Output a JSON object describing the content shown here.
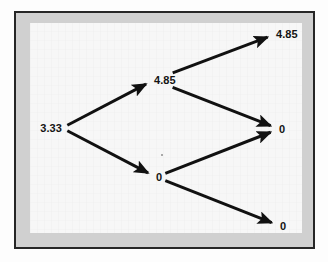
{
  "figure": {
    "type": "binomial-lattice-diagram",
    "frame": {
      "border_color": "#262626",
      "band_color": "#d0d0d0",
      "canvas_color": "#f7f7f7"
    },
    "style": {
      "edge_color": "#111111",
      "edge_width": 3,
      "label_color": "#141414"
    }
  },
  "chart_data": {
    "type": "diagram",
    "subtype": "binomial-tree",
    "xlabel": "",
    "ylabel": "",
    "grid": false,
    "legend": null,
    "periods": 2,
    "nodes": [
      {
        "id": "n0",
        "label": "3.33",
        "value": 3.33,
        "period": 0,
        "level": 0,
        "x": 62,
        "y": 128,
        "anchor": "right"
      },
      {
        "id": "n1u",
        "label": "4.85",
        "value": 4.85,
        "period": 1,
        "level": 1,
        "x": 154,
        "y": 80,
        "anchor": "left"
      },
      {
        "id": "n1d",
        "label": "0",
        "value": 0,
        "period": 1,
        "level": -1,
        "x": 156,
        "y": 177,
        "anchor": "left"
      },
      {
        "id": "n2uu",
        "label": "4.85",
        "value": 4.85,
        "period": 2,
        "level": 2,
        "x": 276,
        "y": 34,
        "anchor": "left"
      },
      {
        "id": "n2ud",
        "label": "0",
        "value": 0,
        "period": 2,
        "level": 0,
        "x": 279,
        "y": 129,
        "anchor": "left"
      },
      {
        "id": "n2dd",
        "label": "0",
        "value": 0,
        "period": 2,
        "level": -2,
        "x": 280,
        "y": 226,
        "anchor": "left"
      }
    ],
    "edges": [
      {
        "id": "e-up-1",
        "from": "n0",
        "to": "n1u",
        "direction": "up"
      },
      {
        "id": "e-down-1",
        "from": "n0",
        "to": "n1d",
        "direction": "down"
      },
      {
        "id": "e-up-2",
        "from": "n1u",
        "to": "n2uu",
        "direction": "up"
      },
      {
        "id": "e-down-2",
        "from": "n1u",
        "to": "n2ud",
        "direction": "down"
      },
      {
        "id": "e-up-3",
        "from": "n1d",
        "to": "n2ud",
        "direction": "up"
      },
      {
        "id": "e-down-3",
        "from": "n1d",
        "to": "n2dd",
        "direction": "down"
      }
    ],
    "values_by_period": [
      [
        3.33
      ],
      [
        4.85,
        0
      ],
      [
        4.85,
        0,
        0
      ]
    ]
  }
}
